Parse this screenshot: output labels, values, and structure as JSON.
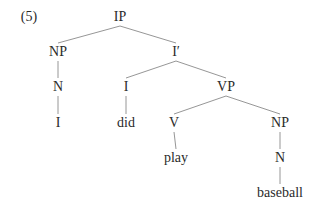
{
  "example_label": "(5)",
  "tree": {
    "nodes": [
      {
        "id": "ip",
        "label": "IP",
        "x": 120,
        "y": 17
      },
      {
        "id": "np1",
        "label": "NP",
        "x": 58,
        "y": 52
      },
      {
        "id": "ibar",
        "label": "I′",
        "x": 176,
        "y": 52
      },
      {
        "id": "n1",
        "label": "N",
        "x": 58,
        "y": 87
      },
      {
        "id": "i",
        "label": "I",
        "x": 126,
        "y": 87
      },
      {
        "id": "vp",
        "label": "VP",
        "x": 226,
        "y": 87
      },
      {
        "id": "w_i",
        "label": "I",
        "x": 58,
        "y": 123
      },
      {
        "id": "w_did",
        "label": "did",
        "x": 126,
        "y": 123
      },
      {
        "id": "v",
        "label": "V",
        "x": 174,
        "y": 123
      },
      {
        "id": "np2",
        "label": "NP",
        "x": 280,
        "y": 123
      },
      {
        "id": "w_play",
        "label": "play",
        "x": 176,
        "y": 158
      },
      {
        "id": "n2",
        "label": "N",
        "x": 280,
        "y": 158
      },
      {
        "id": "w_baseball",
        "label": "baseball",
        "x": 280,
        "y": 193
      }
    ],
    "edges": [
      [
        "ip",
        "np1"
      ],
      [
        "ip",
        "ibar"
      ],
      [
        "np1",
        "n1"
      ],
      [
        "n1",
        "w_i"
      ],
      [
        "ibar",
        "i"
      ],
      [
        "ibar",
        "vp"
      ],
      [
        "i",
        "w_did"
      ],
      [
        "vp",
        "v"
      ],
      [
        "vp",
        "np2"
      ],
      [
        "v",
        "w_play"
      ],
      [
        "np2",
        "n2"
      ],
      [
        "n2",
        "w_baseball"
      ]
    ]
  }
}
